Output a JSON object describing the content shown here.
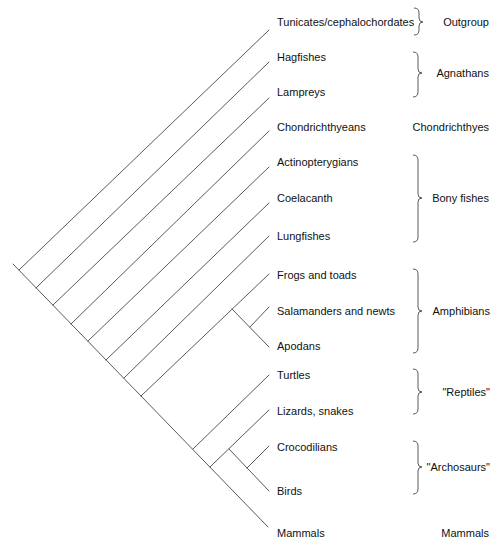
{
  "diagram": {
    "type": "cladogram",
    "taxa": [
      {
        "label": "Tunicates/cephalochordates"
      },
      {
        "label": "Hagfishes"
      },
      {
        "label": "Lampreys"
      },
      {
        "label": "Chondrichthyeans"
      },
      {
        "label": "Actinopterygians"
      },
      {
        "label": "Coelacanth"
      },
      {
        "label": "Lungfishes"
      },
      {
        "label": "Frogs and toads"
      },
      {
        "label": "Salamanders and newts"
      },
      {
        "label": "Apodans"
      },
      {
        "label": "Turtles"
      },
      {
        "label": "Lizards, snakes"
      },
      {
        "label": "Crocodilians"
      },
      {
        "label": "Birds"
      },
      {
        "label": "Mammals"
      }
    ],
    "groups": [
      {
        "label": "Outgroup",
        "bracket": true,
        "members": [
          "Tunicates/cephalochordates"
        ]
      },
      {
        "label": "Agnathans",
        "bracket": true,
        "members": [
          "Hagfishes",
          "Lampreys"
        ]
      },
      {
        "label": "Chondrichthyes",
        "bracket": false,
        "members": [
          "Chondrichthyeans"
        ]
      },
      {
        "label": "Bony fishes",
        "bracket": true,
        "members": [
          "Actinopterygians",
          "Coelacanth",
          "Lungfishes"
        ]
      },
      {
        "label": "Amphibians",
        "bracket": true,
        "members": [
          "Frogs and toads",
          "Salamanders and newts",
          "Apodans"
        ]
      },
      {
        "label": "\"Reptiles\"",
        "bracket": true,
        "members": [
          "Turtles",
          "Lizards, snakes"
        ]
      },
      {
        "label": "\"Archosaurs\"",
        "bracket": true,
        "members": [
          "Crocodilians",
          "Birds"
        ]
      },
      {
        "label": "Mammals",
        "bracket": false,
        "members": [
          "Mammals"
        ]
      }
    ],
    "tree": [
      "Tunicates/cephalochordates",
      [
        "Hagfishes",
        [
          "Lampreys",
          [
            "Chondrichthyeans",
            [
              "Actinopterygians",
              [
                "Coelacanth",
                [
                  "Lungfishes",
                  [
                    [
                      "Frogs and toads",
                      [
                        "Salamanders and newts",
                        "Apodans"
                      ]
                    ],
                    [
                      "Turtles",
                      [
                        [
                          "Lizards, snakes",
                          [
                            "Crocodilians",
                            "Birds"
                          ]
                        ],
                        "Mammals"
                      ]
                    ]
                  ]
                ]
              ]
            ]
          ]
        ]
      ]
    ]
  }
}
